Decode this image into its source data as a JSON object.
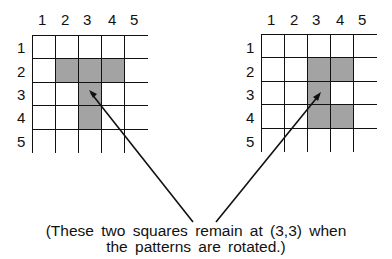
{
  "left_grid": {
    "col_labels": [
      "1",
      "2",
      "3",
      "4",
      "5"
    ],
    "row_labels": [
      "1",
      "2",
      "3",
      "4",
      "5"
    ],
    "shaded_cells": [
      [
        2,
        2
      ],
      [
        2,
        3
      ],
      [
        2,
        4
      ],
      [
        3,
        3
      ],
      [
        4,
        3
      ]
    ]
  },
  "right_grid": {
    "col_labels": [
      "1",
      "2",
      "3",
      "4",
      "5"
    ],
    "row_labels": [
      "1",
      "2",
      "3",
      "4",
      "5"
    ],
    "shaded_cells": [
      [
        2,
        3
      ],
      [
        2,
        4
      ],
      [
        3,
        3
      ],
      [
        4,
        3
      ],
      [
        4,
        4
      ]
    ]
  },
  "caption": {
    "line1": "(These two squares remain at (3,3) when",
    "line2": "the patterns are rotated.)"
  },
  "colors": {
    "shade": "#b0b0b0",
    "line": "#111111"
  }
}
